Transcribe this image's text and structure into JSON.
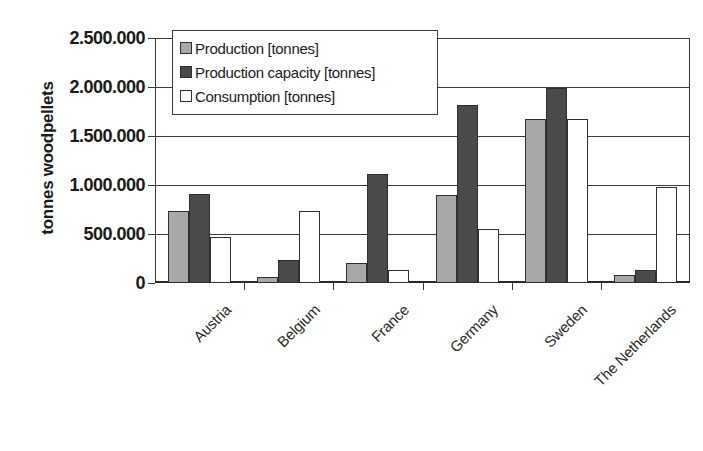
{
  "chart_data": {
    "type": "bar",
    "title": "",
    "xlabel": "",
    "ylabel": "tonnes woodpellets",
    "categories": [
      "Austria",
      "Belgium",
      "France",
      "Germany",
      "Sweden",
      "The Netherlands"
    ],
    "series": [
      {
        "name": "Production [tonnes]",
        "color": "#a8a8a8",
        "values": [
          730000,
          60000,
          200000,
          900000,
          1670000,
          80000
        ]
      },
      {
        "name": "Production capacity [tonnes]",
        "color": "#4a4a4a",
        "values": [
          910000,
          230000,
          1110000,
          1820000,
          1990000,
          130000
        ]
      },
      {
        "name": "Consumption [tonnes]",
        "color": "#ffffff",
        "values": [
          470000,
          730000,
          130000,
          550000,
          1670000,
          980000
        ]
      }
    ],
    "ylim": [
      0,
      2500000
    ],
    "yticks": [
      0,
      500000,
      1000000,
      1500000,
      2000000,
      2500000
    ],
    "ytick_labels": [
      "0",
      "500.000",
      "1.000.000",
      "1.500.000",
      "2.000.000",
      "2.500.000"
    ],
    "grid": true,
    "legend_position": "top-left-inside",
    "bar_border_color": "#2f2f2f",
    "axis_color": "#3a3a3a"
  }
}
